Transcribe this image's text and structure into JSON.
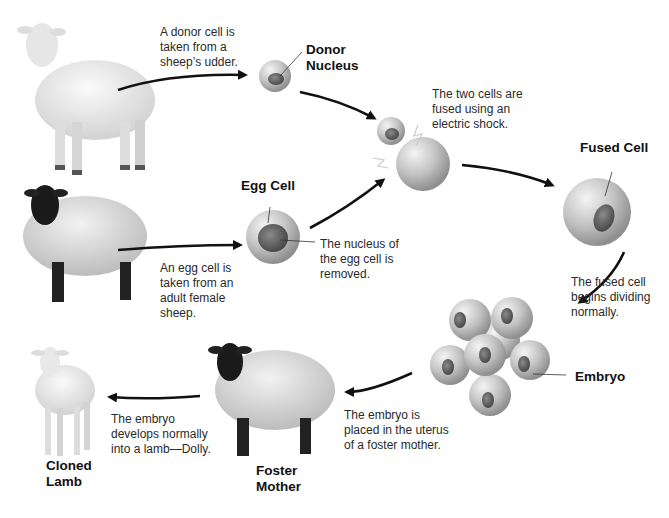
{
  "diagram": {
    "nodes": {
      "donor_sheep": {
        "type": "sheep",
        "color": "white",
        "step": "A donor cell is\ntaken from a\nsheep’s udder."
      },
      "donor_nucleus": {
        "label": "Donor\nNucleus"
      },
      "egg_sheep": {
        "type": "sheep",
        "color": "black-faced",
        "step": "An egg cell is\ntaken from an\nadult female\nsheep."
      },
      "egg_cell": {
        "label": "Egg Cell",
        "note": "The nucleus of\nthe egg cell is\nremoved."
      },
      "fusion": {
        "note": "The two cells are\nfused using an\nelectric shock."
      },
      "fused_cell": {
        "label": "Fused Cell",
        "note": "The fused cell\nbegins dividing\nnormally."
      },
      "embryo": {
        "label": "Embryo",
        "note": "The embryo is\nplaced in the uterus\nof a foster mother."
      },
      "foster_mother": {
        "label": "Foster\nMother",
        "note": "The embryo\ndevelops normally\ninto a lamb—Dolly."
      },
      "cloned_lamb": {
        "label": "Cloned\nLamb"
      }
    },
    "colors": {
      "arrow": "#111111",
      "cell": "#c9c9c9",
      "nucleus": "#6a6a6a",
      "wool_light": "#eeeeee",
      "face_dark": "#1a1a1a"
    }
  }
}
